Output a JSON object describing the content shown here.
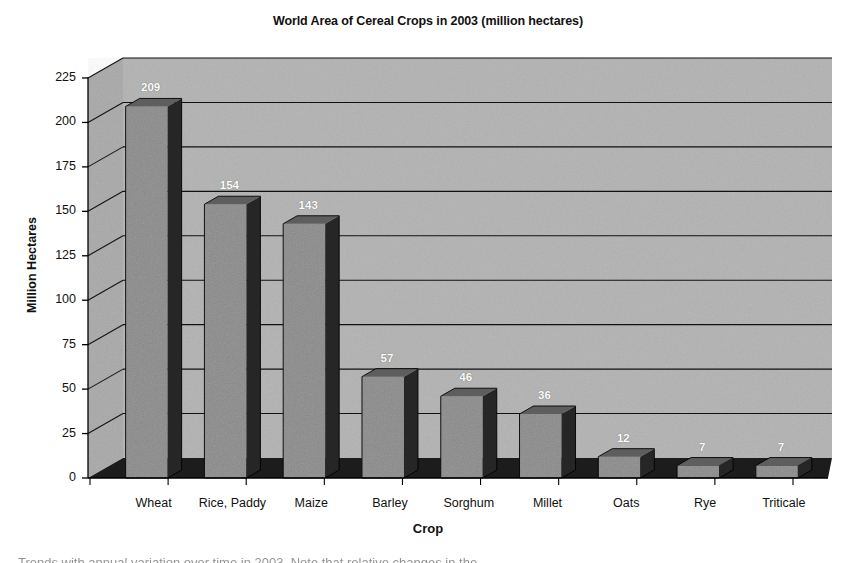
{
  "chart_data": {
    "type": "bar",
    "title": "World Area of Cereal Crops in 2003 (million hectares)",
    "xlabel": "Crop",
    "ylabel": "Million Hectares",
    "categories": [
      "Wheat",
      "Rice, Paddy",
      "Maize",
      "Barley",
      "Sorghum",
      "Millet",
      "Oats",
      "Rye",
      "Triticale"
    ],
    "values": [
      209,
      154,
      143,
      57,
      46,
      36,
      12,
      7,
      7
    ],
    "value_labels": [
      "209",
      "154",
      "143",
      "57",
      "46",
      "36",
      "12",
      "7",
      "7"
    ],
    "ylim": [
      0,
      225
    ],
    "ytick_labels": [
      "0",
      "25",
      "50",
      "75",
      "100",
      "125",
      "150",
      "175",
      "200",
      "225"
    ],
    "ytick_values": [
      0,
      25,
      50,
      75,
      100,
      125,
      150,
      175,
      200,
      225
    ],
    "grid": true,
    "grid_axis": "y",
    "legend": "none",
    "style": "3d-column",
    "colors": {
      "bar_front": "#8a8a8a",
      "bar_top": "#5e5e5e",
      "bar_side": "#262626",
      "back_wall": "#b2b2b2",
      "left_wall": "#a8a8a8",
      "floor": "#1c1c1c",
      "gridline": "#111111",
      "axis": "#000000",
      "label_text": "#ffffff"
    }
  },
  "caption": {
    "clipped_line": "Trends with annual variation over time in 2003. Note that relative changes in the"
  }
}
